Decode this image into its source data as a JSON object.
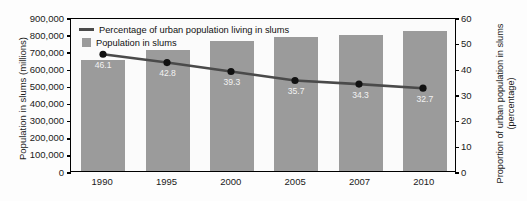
{
  "chart_data": {
    "type": "bar",
    "title": "",
    "categories": [
      "1990",
      "1995",
      "2000",
      "2005",
      "2007",
      "2010"
    ],
    "series": [
      {
        "name": "Population in slums",
        "type": "bar",
        "axis": "left",
        "values": [
          650000,
          710000,
          760000,
          785000,
          797000,
          820000
        ],
        "color": "#9b9b9b"
      },
      {
        "name": "Percentage of urban population living in slums",
        "type": "line",
        "axis": "right",
        "values": [
          46.1,
          42.8,
          39.3,
          35.7,
          34.3,
          32.7
        ],
        "labels": [
          "46.1",
          "42.8",
          "39.3",
          "35.7",
          "34.3",
          "32.7"
        ],
        "color": "#4a4a4a"
      }
    ],
    "xlabel": "",
    "ylabel": "Population in slums  (millions)",
    "ylabel_right": "Proportion of urban population in slums (percentage)",
    "ylim": [
      0,
      900000
    ],
    "ylim_right": [
      0,
      60
    ],
    "yticks": [
      "0",
      "100,000",
      "200,000",
      "300,000",
      "400,000",
      "500,000",
      "600,000",
      "700,000",
      "800,000",
      "900,000"
    ],
    "yticks_right": [
      "0",
      "10",
      "20",
      "30",
      "40",
      "50",
      "60"
    ],
    "grid": false,
    "legend_position": "top-left",
    "legend": [
      "Percentage of urban population living in slums",
      "Population in slums"
    ]
  },
  "axes": {
    "left_title": "Population in slums  (millions)",
    "right_title": "Proportion of urban population in slums (percentage)"
  },
  "legend": {
    "line_label": "Percentage of urban population living in slums",
    "bar_label": "Population in slums"
  },
  "colors": {
    "bar": "#9b9b9b",
    "line": "#4a4a4a",
    "marker": "#111111",
    "axis": "#000000",
    "value_label": "#f2f2f2",
    "background": "#fdfdfd"
  }
}
